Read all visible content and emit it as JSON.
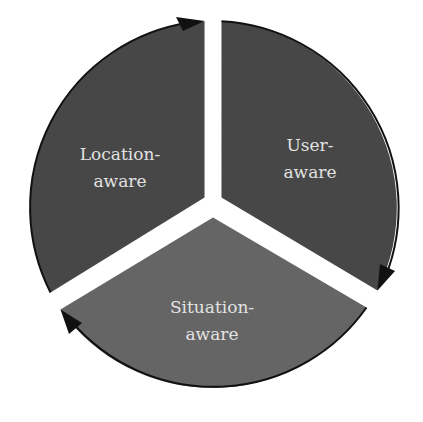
{
  "diagram": {
    "type": "cycle-pie",
    "segments": [
      {
        "id": "location",
        "line1": "Location-",
        "line2": "aware",
        "color": "#4b4b4b"
      },
      {
        "id": "user",
        "line1": "User-",
        "line2": "aware",
        "color": "#4b4b4b"
      },
      {
        "id": "situation",
        "line1": "Situation-",
        "line2": "aware",
        "color": "#6a6a6a"
      }
    ],
    "arrow_color": "#111111",
    "text_color": "#e2e2e2",
    "direction": "clockwise"
  }
}
